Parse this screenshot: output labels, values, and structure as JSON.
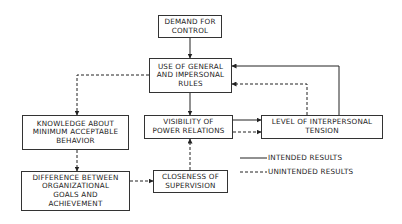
{
  "diagram": {
    "nodes": [
      {
        "id": "demand",
        "label": "DEMAND FOR\nCONTROL"
      },
      {
        "id": "rules",
        "label": "USE OF GENERAL\nAND IMPERSONAL\nRULES"
      },
      {
        "id": "knowledge",
        "label": "KNOWLEDGE ABOUT\nMINIMUM ACCEPTABLE\nBEHAVIOR"
      },
      {
        "id": "visibility",
        "label": "VISIBILITY OF\nPOWER RELATIONS"
      },
      {
        "id": "tension",
        "label": "LEVEL OF INTERPERSONAL\nTENSION"
      },
      {
        "id": "difference",
        "label": "DIFFERENCE BETWEEN\nORGANIZATIONAL\nGOALS AND\nACHIEVEMENT"
      },
      {
        "id": "closeness",
        "label": "CLOSENESS OF\nSUPERVISION"
      }
    ],
    "edges": [
      {
        "from": "demand",
        "to": "rules",
        "style": "solid"
      },
      {
        "from": "rules",
        "to": "visibility",
        "style": "solid"
      },
      {
        "from": "rules",
        "to": "knowledge",
        "style": "dashed"
      },
      {
        "from": "visibility",
        "to": "tension",
        "style": "solid"
      },
      {
        "from": "visibility",
        "to": "tension",
        "style": "dashed"
      },
      {
        "from": "tension",
        "to": "rules",
        "style": "solid"
      },
      {
        "from": "tension",
        "to": "rules",
        "style": "dashed"
      },
      {
        "from": "knowledge",
        "to": "difference",
        "style": "dashed"
      },
      {
        "from": "difference",
        "to": "closeness",
        "style": "dashed"
      },
      {
        "from": "closeness",
        "to": "visibility",
        "style": "dashed"
      }
    ],
    "legend": {
      "intended": "INTENDED RESULTS",
      "unintended": "UNINTENDED RESULTS"
    }
  }
}
